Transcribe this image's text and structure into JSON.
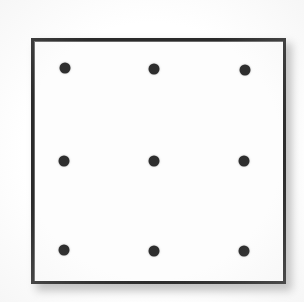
{
  "figure": {
    "caption": "",
    "background_color": "#ffffff"
  },
  "plate": {
    "name": "specimen-plate",
    "face_color": "#fdfdfd",
    "border_color": "#2b2b2b",
    "border_width_px": 3,
    "shadow_color": "#8e8e8e",
    "bounds": {
      "left": 31,
      "top": 38,
      "width": 255,
      "height": 246
    }
  },
  "markers": {
    "shape": "circle",
    "color": "#2e2e2e",
    "diameter_px": 11,
    "rows": 3,
    "columns": 3,
    "count": 9,
    "points": [
      {
        "id": "marker-r1-c1",
        "label": "top-left",
        "x": 65,
        "y": 68
      },
      {
        "id": "marker-r1-c2",
        "label": "top-center",
        "x": 154,
        "y": 69
      },
      {
        "id": "marker-r1-c3",
        "label": "top-right",
        "x": 245,
        "y": 70
      },
      {
        "id": "marker-r2-c1",
        "label": "middle-left",
        "x": 64,
        "y": 161
      },
      {
        "id": "marker-r2-c2",
        "label": "center",
        "x": 154,
        "y": 161
      },
      {
        "id": "marker-r2-c3",
        "label": "middle-right",
        "x": 244,
        "y": 161
      },
      {
        "id": "marker-r3-c1",
        "label": "bottom-left",
        "x": 64,
        "y": 250
      },
      {
        "id": "marker-r3-c2",
        "label": "bottom-center",
        "x": 154,
        "y": 251
      },
      {
        "id": "marker-r3-c3",
        "label": "bottom-right",
        "x": 244,
        "y": 251
      }
    ]
  }
}
